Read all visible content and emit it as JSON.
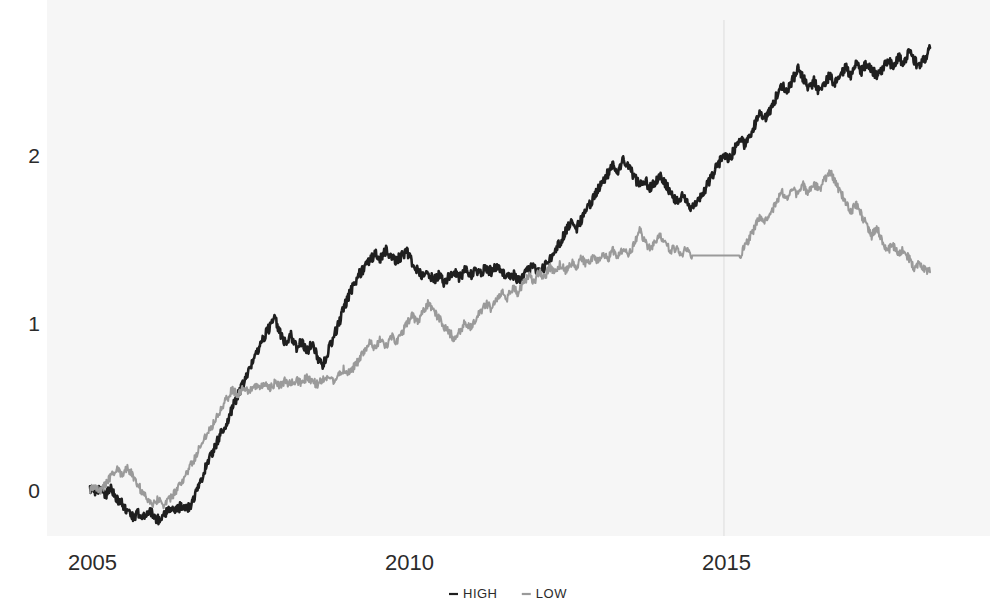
{
  "chart_data": {
    "type": "line",
    "title": "",
    "subtitle": "",
    "xlabel": "",
    "ylabel": "",
    "xlim": [
      2004.6,
      2018.6
    ],
    "ylim": [
      -0.45,
      2.85
    ],
    "grid": false,
    "legend_position": "bottom-center",
    "xticks": [
      "2005",
      "2010",
      "2015"
    ],
    "xtick_values": [
      2005,
      2010,
      2015
    ],
    "yticks": [
      "0",
      "1",
      "2"
    ],
    "ytick_values": [
      0,
      1,
      2
    ],
    "legend": [
      {
        "name": "HIGH",
        "color": "#1f1f1f",
        "marker": "-"
      },
      {
        "name": "LOW",
        "color": "#9a9a9a",
        "marker": "-"
      }
    ],
    "series": [
      {
        "name": "HIGH",
        "color": "#1f1f1f",
        "x": [
          2005.0,
          2005.08,
          2005.17,
          2005.25,
          2005.33,
          2005.42,
          2005.5,
          2005.58,
          2005.67,
          2005.75,
          2005.83,
          2005.92,
          2006.0,
          2006.08,
          2006.17,
          2006.25,
          2006.33,
          2006.42,
          2006.5,
          2006.58,
          2006.67,
          2006.75,
          2006.83,
          2006.92,
          2007.0,
          2007.08,
          2007.17,
          2007.25,
          2007.33,
          2007.42,
          2007.5,
          2007.58,
          2007.67,
          2007.75,
          2007.83,
          2007.92,
          2008.0,
          2008.08,
          2008.17,
          2008.25,
          2008.33,
          2008.42,
          2008.5,
          2008.58,
          2008.67,
          2008.75,
          2008.83,
          2008.92,
          2009.0,
          2009.08,
          2009.17,
          2009.25,
          2009.33,
          2009.42,
          2009.5,
          2009.58,
          2009.67,
          2009.75,
          2009.83,
          2009.92,
          2010.0,
          2010.08,
          2010.17,
          2010.25,
          2010.33,
          2010.42,
          2010.5,
          2010.58,
          2010.67,
          2010.75,
          2010.83,
          2010.92,
          2011.0,
          2011.08,
          2011.17,
          2011.25,
          2011.33,
          2011.42,
          2011.5,
          2011.58,
          2011.67,
          2011.75,
          2011.83,
          2011.92,
          2012.0,
          2012.08,
          2012.17,
          2012.25,
          2012.33,
          2012.42,
          2012.5,
          2012.58,
          2012.67,
          2012.75,
          2012.83,
          2012.92,
          2013.0,
          2013.08,
          2013.17,
          2013.25,
          2013.33,
          2013.42,
          2013.5,
          2013.58,
          2013.67,
          2013.75,
          2013.83,
          2013.92,
          2014.0,
          2014.08,
          2014.17,
          2014.25,
          2014.33,
          2014.42,
          2014.5,
          2014.58,
          2014.67,
          2014.75,
          2014.83,
          2014.92,
          2015.0,
          2015.08,
          2015.17,
          2015.25,
          2015.33,
          2015.42,
          2015.5,
          2015.58,
          2015.67,
          2015.75,
          2015.83,
          2015.92,
          2016.0,
          2016.08,
          2016.17,
          2016.25,
          2016.33,
          2016.42,
          2016.5,
          2016.58,
          2016.67,
          2016.75,
          2016.83,
          2016.92,
          2017.0,
          2017.08,
          2017.17,
          2017.25,
          2017.33,
          2017.42,
          2017.5,
          2017.58,
          2017.67,
          2017.75,
          2017.83,
          2017.92,
          2018.0,
          2018.08,
          2018.17,
          2018.25
        ],
        "y": [
          0.0,
          -0.02,
          0.02,
          -0.03,
          0.01,
          -0.05,
          -0.08,
          -0.12,
          -0.16,
          -0.14,
          -0.17,
          -0.12,
          -0.15,
          -0.18,
          -0.14,
          -0.11,
          -0.13,
          -0.1,
          -0.12,
          -0.09,
          -0.02,
          0.06,
          0.14,
          0.22,
          0.28,
          0.35,
          0.41,
          0.49,
          0.57,
          0.63,
          0.7,
          0.78,
          0.86,
          0.92,
          0.97,
          1.02,
          0.94,
          0.88,
          0.92,
          0.85,
          0.88,
          0.83,
          0.87,
          0.8,
          0.75,
          0.82,
          0.9,
          0.99,
          1.08,
          1.16,
          1.23,
          1.29,
          1.33,
          1.38,
          1.41,
          1.38,
          1.43,
          1.4,
          1.37,
          1.4,
          1.43,
          1.36,
          1.31,
          1.27,
          1.3,
          1.25,
          1.28,
          1.24,
          1.27,
          1.3,
          1.27,
          1.31,
          1.28,
          1.32,
          1.29,
          1.33,
          1.3,
          1.34,
          1.31,
          1.27,
          1.29,
          1.25,
          1.28,
          1.31,
          1.34,
          1.3,
          1.33,
          1.37,
          1.42,
          1.48,
          1.54,
          1.59,
          1.56,
          1.61,
          1.67,
          1.73,
          1.78,
          1.84,
          1.89,
          1.95,
          1.9,
          1.98,
          1.93,
          1.87,
          1.82,
          1.86,
          1.8,
          1.84,
          1.88,
          1.83,
          1.77,
          1.72,
          1.76,
          1.71,
          1.68,
          1.72,
          1.77,
          1.83,
          1.89,
          1.95,
          2.01,
          1.97,
          2.04,
          2.1,
          2.06,
          2.13,
          2.19,
          2.25,
          2.22,
          2.29,
          2.35,
          2.42,
          2.38,
          2.45,
          2.51,
          2.46,
          2.4,
          2.44,
          2.38,
          2.43,
          2.47,
          2.42,
          2.47,
          2.52,
          2.48,
          2.54,
          2.5,
          2.55,
          2.51,
          2.47,
          2.52,
          2.57,
          2.53,
          2.59,
          2.55,
          2.61,
          2.57,
          2.52,
          2.58,
          2.64
        ],
        "last_value": 2.64
      },
      {
        "name": "LOW",
        "color": "#9a9a9a",
        "x": [
          2005.0,
          2005.08,
          2005.17,
          2005.25,
          2005.33,
          2005.42,
          2005.5,
          2005.58,
          2005.67,
          2005.75,
          2005.83,
          2005.92,
          2006.0,
          2006.08,
          2006.17,
          2006.25,
          2006.33,
          2006.42,
          2006.5,
          2006.58,
          2006.67,
          2006.75,
          2006.83,
          2006.92,
          2007.0,
          2007.08,
          2007.17,
          2007.25,
          2007.33,
          2007.42,
          2007.5,
          2007.58,
          2007.67,
          2007.75,
          2007.83,
          2007.92,
          2008.0,
          2008.08,
          2008.17,
          2008.25,
          2008.33,
          2008.42,
          2008.5,
          2008.58,
          2008.67,
          2008.75,
          2008.83,
          2008.92,
          2009.0,
          2009.08,
          2009.17,
          2009.25,
          2009.33,
          2009.42,
          2009.5,
          2009.58,
          2009.67,
          2009.75,
          2009.83,
          2009.92,
          2010.0,
          2010.08,
          2010.17,
          2010.25,
          2010.33,
          2010.42,
          2010.5,
          2010.58,
          2010.67,
          2010.75,
          2010.83,
          2010.92,
          2011.0,
          2011.08,
          2011.17,
          2011.25,
          2011.33,
          2011.42,
          2011.5,
          2011.58,
          2011.67,
          2011.75,
          2011.83,
          2011.92,
          2012.0,
          2012.08,
          2012.17,
          2012.25,
          2012.33,
          2012.42,
          2012.5,
          2012.58,
          2012.67,
          2012.75,
          2012.83,
          2012.92,
          2013.0,
          2013.08,
          2013.17,
          2013.25,
          2013.33,
          2013.42,
          2013.5,
          2013.58,
          2013.67,
          2013.75,
          2013.83,
          2013.92,
          2014.0,
          2014.08,
          2014.17,
          2014.25,
          2014.33,
          2014.42,
          2014.5,
          2014.58,
          2014.67,
          2014.75,
          2014.83,
          2014.92,
          2015.0,
          2015.08,
          2015.17,
          2015.25,
          2015.33,
          2015.42,
          2015.5,
          2015.58,
          2015.67,
          2015.75,
          2015.83,
          2015.92,
          2016.0,
          2016.08,
          2016.17,
          2016.25,
          2016.33,
          2016.42,
          2016.5,
          2016.58,
          2016.67,
          2016.75,
          2016.83,
          2016.92,
          2017.0,
          2017.08,
          2017.17,
          2017.25,
          2017.33,
          2017.42,
          2017.5,
          2017.58,
          2017.67,
          2017.75,
          2017.83,
          2017.92,
          2018.0,
          2018.08,
          2018.17,
          2018.25
        ],
        "y": [
          0.0,
          0.03,
          -0.01,
          0.04,
          0.08,
          0.12,
          0.1,
          0.13,
          0.09,
          0.04,
          -0.02,
          -0.06,
          -0.08,
          -0.05,
          -0.09,
          -0.06,
          -0.02,
          0.03,
          0.08,
          0.14,
          0.2,
          0.27,
          0.33,
          0.38,
          0.44,
          0.5,
          0.55,
          0.6,
          0.57,
          0.61,
          0.58,
          0.62,
          0.6,
          0.63,
          0.61,
          0.64,
          0.62,
          0.65,
          0.63,
          0.66,
          0.64,
          0.67,
          0.65,
          0.63,
          0.66,
          0.68,
          0.65,
          0.69,
          0.72,
          0.7,
          0.74,
          0.78,
          0.83,
          0.88,
          0.84,
          0.9,
          0.86,
          0.92,
          0.88,
          0.94,
          0.99,
          1.04,
          1.0,
          1.06,
          1.11,
          1.07,
          1.03,
          0.98,
          0.94,
          0.9,
          0.95,
          1.0,
          0.96,
          1.02,
          1.07,
          1.12,
          1.08,
          1.14,
          1.19,
          1.15,
          1.21,
          1.17,
          1.23,
          1.28,
          1.24,
          1.3,
          1.27,
          1.33,
          1.3,
          1.35,
          1.31,
          1.36,
          1.33,
          1.38,
          1.35,
          1.39,
          1.36,
          1.41,
          1.38,
          1.43,
          1.39,
          1.44,
          1.41,
          1.46,
          1.55,
          1.49,
          1.44,
          1.48,
          1.52,
          1.47,
          1.43,
          1.45,
          1.41,
          1.44,
          1.4,
          1.4,
          1.4,
          1.4,
          1.4,
          1.4,
          1.4,
          1.4,
          1.4,
          1.4,
          1.45,
          1.52,
          1.58,
          1.64,
          1.6,
          1.66,
          1.72,
          1.78,
          1.74,
          1.8,
          1.76,
          1.82,
          1.77,
          1.83,
          1.79,
          1.85,
          1.9,
          1.84,
          1.78,
          1.72,
          1.66,
          1.71,
          1.64,
          1.58,
          1.52,
          1.56,
          1.49,
          1.43,
          1.46,
          1.4,
          1.44,
          1.38,
          1.33,
          1.36,
          1.31,
          1.3
        ],
        "last_value": 1.3
      }
    ],
    "annotations": [
      {
        "type": "vline",
        "x": 2015,
        "color": "#dcdcdc"
      }
    ]
  }
}
